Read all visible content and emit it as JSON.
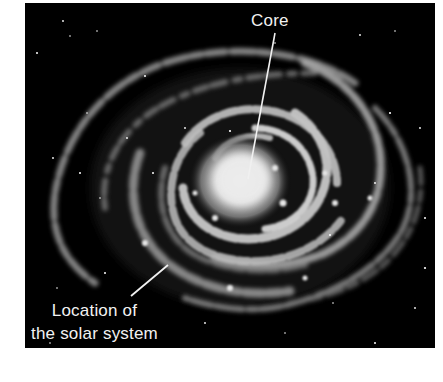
{
  "figure": {
    "background_color": "#000000",
    "annotations": [
      {
        "id": "core",
        "text": "Core",
        "points_to": "galactic core"
      },
      {
        "id": "solar_system",
        "text_lines": [
          "Location of",
          "the solar system"
        ],
        "points_to": "outer spiral arm, lower left"
      }
    ]
  }
}
